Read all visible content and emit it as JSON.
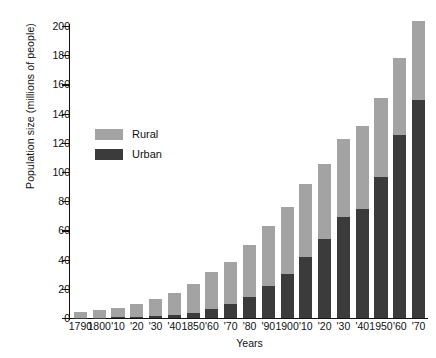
{
  "chart_data": {
    "type": "bar",
    "subtype": "stacked-bar",
    "title": "",
    "xlabel": "Years",
    "ylabel": "Population size (millions of people)",
    "ylim": [
      0,
      200
    ],
    "ytick_values": [
      0,
      20,
      40,
      60,
      80,
      100,
      120,
      140,
      160,
      180,
      200
    ],
    "ytick_labels": [
      "0",
      "20",
      "40",
      "60",
      "80",
      "100",
      "120",
      "140",
      "160",
      "180",
      "200"
    ],
    "grid": false,
    "legend_position": "upper-left-inside",
    "categories": [
      "1790",
      "1800",
      "'10",
      "'20",
      "'30",
      "'40",
      "1850",
      "'60",
      "'70",
      "'80",
      "'90",
      "1900",
      "'10",
      "'20",
      "'30",
      "'40",
      "1950",
      "'60",
      "'70"
    ],
    "category_years": [
      1790,
      1800,
      1810,
      1820,
      1830,
      1840,
      1850,
      1860,
      1870,
      1880,
      1890,
      1900,
      1910,
      1920,
      1930,
      1940,
      1950,
      1960,
      1970
    ],
    "series": [
      {
        "name": "Urban",
        "color": "#3b3b3b",
        "values": [
          0.2,
          0.3,
          0.5,
          0.7,
          1.1,
          1.8,
          3.5,
          6.2,
          9.9,
          14.1,
          22.1,
          30.2,
          42.0,
          54.2,
          69.0,
          74.4,
          96.5,
          125.3,
          149.3
        ]
      },
      {
        "name": "Rural",
        "color": "#a3a3a3",
        "values": [
          3.7,
          5.0,
          6.7,
          9.0,
          11.7,
          15.2,
          19.6,
          25.2,
          28.7,
          36.0,
          40.8,
          45.8,
          50.0,
          51.6,
          53.8,
          57.2,
          54.0,
          53.0,
          54.3
        ]
      }
    ],
    "totals": [
      3.9,
      5.3,
      7.2,
      9.7,
      12.8,
      17.0,
      23.1,
      31.4,
      38.6,
      50.1,
      62.9,
      76.0,
      92.0,
      105.8,
      122.8,
      131.6,
      150.5,
      178.3,
      203.6
    ],
    "annotations": []
  },
  "legend": {
    "items": [
      {
        "label": "Rural",
        "color": "#a3a3a3"
      },
      {
        "label": "Urban",
        "color": "#3b3b3b"
      }
    ]
  },
  "axes": {
    "y_title": "Population size (millions of people)",
    "x_title": "Years"
  }
}
